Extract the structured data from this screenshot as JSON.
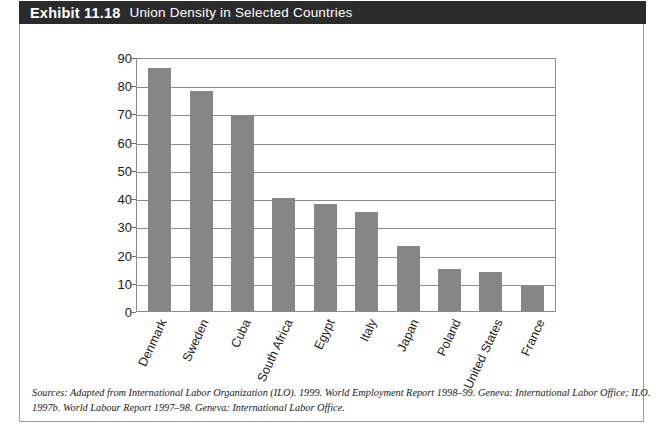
{
  "exhibit": {
    "label": "Exhibit 11.18",
    "title": "Union Density in Selected Countries"
  },
  "source": {
    "line1": "Sources: Adapted from International Labor Organization (ILO). 1999. World Employment Report 1998–99. Geneva: International Labor Office; ILO.",
    "line2": "1997b. World Labour Report 1997–98. Geneva: International Labor Office."
  },
  "colors": {
    "header_background": "#2b2b2b",
    "header_text": "#ffffff",
    "bar_fill": "#868686",
    "axis_line": "#8c8c8c",
    "frame_border": "#9b9b9b"
  },
  "chart_data": {
    "type": "bar",
    "title": "Union Density in Selected Countries",
    "xlabel": "",
    "ylabel": "",
    "ylim": [
      0,
      90
    ],
    "yticks": [
      0,
      10,
      20,
      30,
      40,
      50,
      60,
      70,
      80,
      90
    ],
    "grid": "horizontal",
    "legend": "none",
    "categories": [
      "Denmark",
      "Sweden",
      "Cuba",
      "South Africa",
      "Egypt",
      "Italy",
      "Japan",
      "Poland",
      "United States",
      "France"
    ],
    "values": [
      86,
      78,
      69,
      40,
      38,
      35,
      23,
      15,
      14,
      9
    ]
  }
}
